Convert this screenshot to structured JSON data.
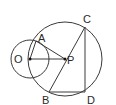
{
  "diagram": {
    "type": "geometry",
    "stroke_color": "#3a3a3a",
    "points": {
      "O": {
        "label": "O",
        "x": 30,
        "y": 59
      },
      "P": {
        "label": "P",
        "x": 65,
        "y": 59
      },
      "A": {
        "label": "A",
        "x": 36,
        "y": 41
      },
      "B": {
        "label": "B",
        "x": 49,
        "y": 92
      },
      "C": {
        "label": "C",
        "x": 85,
        "y": 27
      },
      "D": {
        "label": "D",
        "x": 85,
        "y": 92
      }
    },
    "circles": [
      {
        "name": "small-circle",
        "center": "O",
        "r": 19
      },
      {
        "name": "large-circle",
        "center": "P",
        "r": 37
      }
    ],
    "segments": [
      "OP",
      "OA",
      "AP",
      "BC",
      "CD",
      "BD"
    ]
  }
}
